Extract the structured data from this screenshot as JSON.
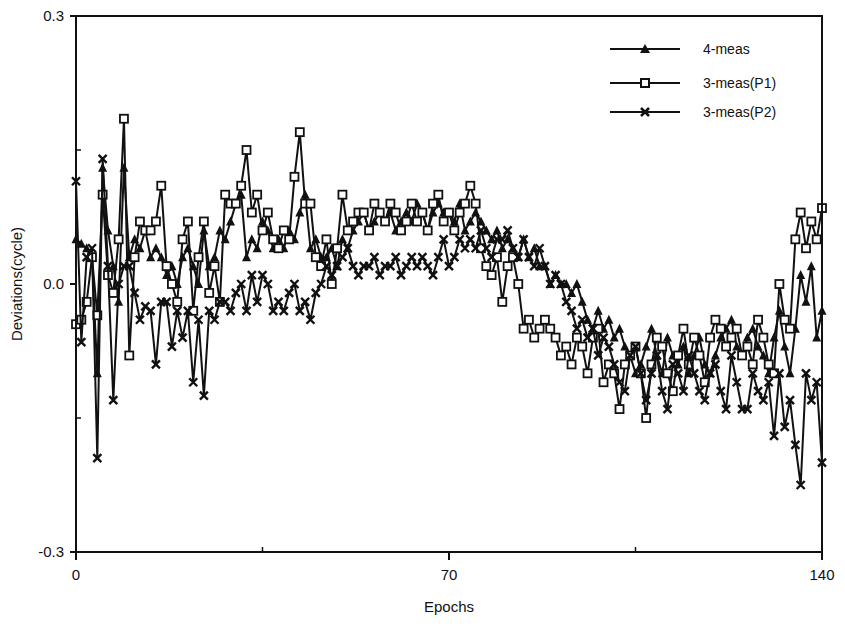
{
  "chart_data": {
    "type": "line",
    "title": "",
    "xlabel": "Epochs",
    "ylabel": "Deviations(cycle)",
    "xlim": [
      0,
      140
    ],
    "ylim": [
      -0.3,
      0.3
    ],
    "x_ticks": [
      0,
      70,
      140
    ],
    "x_minor_ticks": [
      35,
      105
    ],
    "y_ticks": [
      0.3,
      0.0,
      -0.3
    ],
    "y_tick_labels": [
      "0.3",
      "0.0",
      "-0.3"
    ],
    "x_tick_labels": [
      "0",
      "70",
      "140"
    ],
    "grid": false,
    "legend_position": "upper right",
    "x": [
      0,
      1,
      2,
      3,
      4,
      5,
      6,
      7,
      8,
      9,
      10,
      11,
      12,
      13,
      14,
      15,
      16,
      17,
      18,
      19,
      20,
      21,
      22,
      23,
      24,
      25,
      26,
      27,
      28,
      29,
      30,
      31,
      32,
      33,
      34,
      35,
      36,
      37,
      38,
      39,
      40,
      41,
      42,
      43,
      44,
      45,
      46,
      47,
      48,
      49,
      50,
      51,
      52,
      53,
      54,
      55,
      56,
      57,
      58,
      59,
      60,
      61,
      62,
      63,
      64,
      65,
      66,
      67,
      68,
      69,
      70,
      71,
      72,
      73,
      74,
      75,
      76,
      77,
      78,
      79,
      80,
      81,
      82,
      83,
      84,
      85,
      86,
      87,
      88,
      89,
      90,
      91,
      92,
      93,
      94,
      95,
      96,
      97,
      98,
      99,
      100,
      101,
      102,
      103,
      104,
      105,
      106,
      107,
      108,
      109,
      110,
      111,
      112,
      113,
      114,
      115,
      116,
      117,
      118,
      119,
      120,
      121,
      122,
      123,
      124,
      125,
      126,
      127,
      128,
      129,
      130,
      131,
      132,
      133,
      134,
      135,
      136,
      137,
      138,
      139,
      140
    ],
    "series": [
      {
        "name": "4-meas",
        "marker": "triangle",
        "values": [
          0.05,
          0.045,
          0.04,
          0.03,
          -0.1,
          0.13,
          0.06,
          0.02,
          -0.02,
          0.13,
          0.03,
          0.05,
          0.04,
          0.06,
          0.03,
          0.04,
          0.03,
          0.01,
          0.02,
          0.0,
          0.03,
          0.04,
          0.02,
          0.0,
          0.06,
          0.02,
          0.03,
          0.06,
          0.05,
          0.07,
          0.09,
          0.1,
          0.03,
          0.05,
          0.04,
          0.07,
          0.06,
          0.04,
          0.05,
          0.04,
          0.06,
          0.05,
          0.08,
          0.1,
          0.04,
          0.05,
          0.03,
          0.03,
          0.04,
          0.02,
          0.05,
          0.04,
          0.06,
          0.07,
          0.08,
          0.06,
          0.07,
          0.08,
          0.07,
          0.08,
          0.06,
          0.07,
          0.08,
          0.07,
          0.09,
          0.08,
          0.06,
          0.08,
          0.09,
          0.08,
          0.08,
          0.07,
          0.09,
          0.06,
          0.07,
          0.08,
          0.07,
          0.06,
          0.05,
          0.06,
          0.04,
          0.05,
          0.04,
          0.03,
          0.05,
          0.03,
          0.04,
          0.02,
          0.02,
          0.0,
          0.01,
          0.0,
          0.0,
          -0.01,
          0.0,
          -0.02,
          -0.04,
          -0.05,
          -0.03,
          -0.05,
          -0.04,
          -0.06,
          -0.05,
          -0.07,
          -0.08,
          -0.1,
          -0.09,
          -0.07,
          -0.05,
          -0.08,
          -0.1,
          -0.06,
          -0.08,
          -0.09,
          -0.07,
          -0.1,
          -0.08,
          -0.06,
          -0.09,
          -0.1,
          -0.08,
          -0.06,
          -0.05,
          -0.04,
          -0.07,
          -0.08,
          -0.06,
          -0.05,
          -0.07,
          -0.08,
          -0.1,
          -0.06,
          -0.03,
          -0.07,
          -0.1,
          -0.05,
          0.01,
          -0.02,
          0.02,
          -0.06,
          -0.03
        ]
      },
      {
        "name": "3-meas(P1)",
        "marker": "square",
        "values": [
          -0.045,
          -0.04,
          -0.02,
          0.03,
          -0.035,
          0.1,
          0.01,
          -0.01,
          0.05,
          0.185,
          -0.08,
          0.03,
          0.07,
          0.06,
          0.06,
          0.07,
          0.11,
          0.02,
          0.0,
          -0.02,
          0.05,
          0.07,
          -0.03,
          0.03,
          0.07,
          -0.01,
          0.02,
          -0.02,
          0.1,
          0.09,
          0.09,
          0.11,
          0.15,
          0.08,
          0.1,
          0.06,
          0.08,
          0.05,
          0.04,
          0.06,
          0.05,
          0.12,
          0.17,
          0.09,
          0.09,
          0.03,
          0.02,
          0.05,
          0.0,
          0.04,
          0.1,
          0.06,
          0.07,
          0.08,
          0.08,
          0.06,
          0.09,
          0.08,
          0.07,
          0.09,
          0.08,
          0.06,
          0.07,
          0.09,
          0.07,
          0.08,
          0.06,
          0.09,
          0.1,
          0.07,
          0.08,
          0.06,
          0.08,
          0.09,
          0.11,
          0.09,
          0.04,
          0.02,
          0.01,
          0.03,
          -0.02,
          0.02,
          0.03,
          0.0,
          -0.05,
          -0.04,
          -0.06,
          -0.05,
          -0.04,
          -0.05,
          -0.06,
          -0.08,
          -0.07,
          -0.09,
          -0.06,
          -0.07,
          -0.1,
          -0.06,
          -0.05,
          -0.11,
          -0.09,
          -0.1,
          -0.14,
          -0.09,
          -0.08,
          -0.07,
          -0.1,
          -0.15,
          -0.09,
          -0.06,
          -0.07,
          -0.1,
          -0.12,
          -0.08,
          -0.05,
          -0.09,
          -0.06,
          -0.08,
          -0.11,
          -0.06,
          -0.04,
          -0.05,
          -0.07,
          -0.06,
          -0.05,
          -0.08,
          -0.07,
          -0.09,
          -0.04,
          -0.06,
          -0.09,
          -0.1,
          0.0,
          -0.04,
          -0.05,
          0.05,
          0.08,
          0.04,
          0.07,
          0.05,
          0.085
        ]
      },
      {
        "name": "3-meas(P2)",
        "marker": "x",
        "values": [
          0.115,
          -0.065,
          0.03,
          0.04,
          -0.195,
          0.14,
          0.02,
          -0.13,
          0.0,
          0.02,
          0.02,
          -0.01,
          -0.04,
          -0.025,
          -0.03,
          -0.09,
          -0.02,
          -0.02,
          -0.07,
          -0.03,
          -0.06,
          -0.03,
          -0.11,
          -0.04,
          -0.125,
          -0.03,
          -0.04,
          -0.02,
          -0.02,
          -0.03,
          -0.01,
          0.0,
          -0.03,
          0.01,
          -0.02,
          0.01,
          0.0,
          -0.03,
          -0.02,
          -0.03,
          -0.01,
          0.0,
          -0.03,
          -0.02,
          -0.04,
          -0.01,
          0.0,
          0.02,
          0.01,
          0.02,
          0.03,
          0.04,
          0.02,
          0.01,
          0.02,
          0.02,
          0.03,
          0.01,
          0.02,
          0.02,
          0.03,
          0.01,
          0.02,
          0.03,
          0.02,
          0.03,
          0.02,
          0.01,
          0.03,
          0.05,
          0.02,
          0.03,
          0.05,
          0.04,
          0.05,
          0.04,
          0.06,
          0.04,
          0.03,
          0.05,
          0.05,
          0.06,
          0.04,
          0.03,
          0.05,
          0.03,
          0.02,
          0.04,
          0.02,
          0.0,
          0.01,
          0.0,
          -0.02,
          -0.03,
          -0.05,
          -0.04,
          -0.06,
          -0.05,
          -0.08,
          -0.06,
          -0.07,
          -0.09,
          -0.11,
          -0.12,
          -0.08,
          -0.07,
          -0.1,
          -0.13,
          -0.1,
          -0.08,
          -0.12,
          -0.14,
          -0.09,
          -0.1,
          -0.12,
          -0.08,
          -0.1,
          -0.12,
          -0.13,
          -0.1,
          -0.09,
          -0.12,
          -0.14,
          -0.08,
          -0.11,
          -0.14,
          -0.14,
          -0.1,
          -0.12,
          -0.13,
          -0.11,
          -0.17,
          -0.1,
          -0.16,
          -0.13,
          -0.18,
          -0.225,
          -0.1,
          -0.13,
          -0.11,
          -0.2
        ]
      }
    ]
  },
  "axes": {
    "x_title": "Epochs",
    "y_title": "Deviations(cycle)"
  },
  "legend": {
    "items": [
      {
        "label": "4-meas",
        "marker": "triangle"
      },
      {
        "label": "3-meas(P1)",
        "marker": "square"
      },
      {
        "label": "3-meas(P2)",
        "marker": "x"
      }
    ]
  },
  "colors": {
    "ink": "#111111",
    "background": "#ffffff"
  }
}
